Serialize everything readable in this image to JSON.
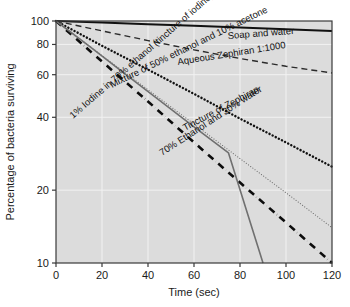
{
  "chart_data": {
    "type": "line",
    "title": "",
    "xlabel": "Time (sec)",
    "ylabel": "Percentage of bacteria surviving",
    "xlim": [
      0,
      120
    ],
    "ylim": [
      10,
      100
    ],
    "yscale": "log",
    "grid": true,
    "legend_position": "inline-labels",
    "xticks": [
      "0",
      "20",
      "40",
      "60",
      "80",
      "100",
      "120"
    ],
    "xtick_values": [
      0,
      20,
      40,
      60,
      80,
      100,
      120
    ],
    "yticks": [
      "100",
      "80",
      "60",
      "40",
      "20",
      "10"
    ],
    "ytick_values": [
      100,
      80,
      60,
      40,
      20,
      10
    ],
    "plot_bg": "#dcdcdc",
    "grid_color": "#f2f2f2",
    "series": [
      {
        "name": "Soap and water",
        "label": "Soap and water",
        "style": "solid",
        "color": "#111111",
        "width": 2.0,
        "x": [
          0,
          20,
          40,
          60,
          80,
          100,
          120
        ],
        "values": [
          100,
          98.5,
          97,
          95.5,
          94,
          92.5,
          91
        ]
      },
      {
        "name": "Aqueous Zephiran 1:1000",
        "label": "Aqueous Zephiran 1:1000",
        "style": "dashed",
        "color": "#2b2b2b",
        "width": 1.4,
        "x": [
          0,
          20,
          40,
          60,
          80,
          100,
          120
        ],
        "values": [
          100,
          91,
          83,
          76,
          70,
          65,
          61
        ]
      },
      {
        "name": "Mixture of 50% ethanol and 10% acetone",
        "label": "Mixture of 50% ethanol and 10% acetone",
        "style": "dotted",
        "color": "#111111",
        "width": 2.4,
        "x": [
          0,
          20,
          40,
          60,
          80,
          100,
          120
        ],
        "values": [
          100,
          79,
          63,
          50,
          39.5,
          31.5,
          25
        ]
      },
      {
        "name": "Tincture of Zephiran",
        "label": "Tincture of Zephiran",
        "style": "fine-dotted",
        "color": "#6e6e6e",
        "width": 1.1,
        "x": [
          0,
          20,
          40,
          60,
          80,
          100,
          120
        ],
        "values": [
          100,
          72,
          52,
          37.5,
          27,
          19.5,
          14
        ]
      },
      {
        "name": "70% Ethanol and 30% water",
        "label": "70% Ethanol and 30% water",
        "style": "dash-dot",
        "color": "#0d0d0d",
        "width": 2.6,
        "x": [
          0,
          20,
          40,
          60,
          80,
          100,
          120
        ],
        "values": [
          100,
          68,
          46.5,
          31.5,
          21.5,
          14.7,
          10
        ]
      },
      {
        "name": "1% Iodine in 70% ethanol (tincture of iodine)",
        "label": "1% Iodine in 70% ethanol (tincture of iodine)",
        "style": "solid",
        "color": "#707070",
        "width": 1.6,
        "x": [
          0,
          15,
          30,
          45,
          60,
          75,
          90
        ],
        "values": [
          100,
          78,
          60.5,
          47,
          36.5,
          28.5,
          10
        ]
      }
    ],
    "annotations": [
      {
        "text": "Soap and water",
        "x": 228,
        "y": 39,
        "rotate": -4.5
      },
      {
        "text": "Aqueous Zephiran 1:1000",
        "x": 178,
        "y": 65,
        "rotate": -9
      },
      {
        "text": "Mixture of 50% ethanol and 10% acetone",
        "x": 112,
        "y": 88,
        "rotate": -26
      },
      {
        "text": "Tincture of Zephiran",
        "x": 185,
        "y": 131,
        "rotate": -28
      },
      {
        "text": "70% Ethanol and 30% water",
        "x": 162,
        "y": 156,
        "rotate": -33
      },
      {
        "text": "1% Iodine in 70% ethanol (tincture of iodine)",
        "x": 73,
        "y": 119,
        "rotate": -41
      }
    ]
  }
}
